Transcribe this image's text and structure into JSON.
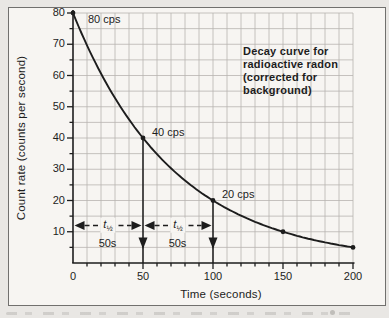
{
  "colors": {
    "ink": "#1d1d1d",
    "grid": "#b7b4b0",
    "paper": "#f7f5f2",
    "page_background": "#e9e7e4",
    "frame_border": "#71706e"
  },
  "figure": {
    "title_lines": [
      "Decay curve for",
      "radioactive radon",
      "(corrected for",
      "background)"
    ]
  },
  "chart_data": {
    "type": "line",
    "title": "Decay curve for radioactive radon (corrected for background)",
    "xlabel": "Time (seconds)",
    "ylabel": "Count rate (counts per second)",
    "x": [
      0,
      50,
      100,
      150,
      200
    ],
    "values": [
      80,
      40,
      20,
      10,
      5
    ],
    "xlim": [
      0,
      200
    ],
    "ylim": [
      0,
      80
    ],
    "x_major_ticks": [
      0,
      50,
      100,
      150,
      200
    ],
    "y_major_ticks": [
      10,
      20,
      30,
      40,
      50,
      60,
      70,
      80
    ],
    "x_minor_step": 10,
    "y_minor_step": 5,
    "grid": "on",
    "grid_x_step": 10,
    "grid_y_step": 5,
    "half_life_seconds": 50
  },
  "annotations": {
    "point_labels": [
      {
        "text": "80 cps",
        "t": 0,
        "value": 80
      },
      {
        "text": "40 cps",
        "t": 50,
        "value": 40
      },
      {
        "text": "20 cps",
        "t": 100,
        "value": 20
      }
    ],
    "half_life_spans": [
      {
        "from_t": 0,
        "to_t": 50,
        "symbol_main": "t",
        "symbol_sub": "½",
        "duration": "50s"
      },
      {
        "from_t": 50,
        "to_t": 100,
        "symbol_main": "t",
        "symbol_sub": "½",
        "duration": "50s"
      }
    ],
    "drop_arrows": [
      {
        "t": 50,
        "from_value": 40
      },
      {
        "t": 100,
        "from_value": 20
      }
    ]
  }
}
